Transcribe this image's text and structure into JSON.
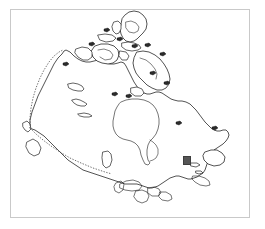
{
  "figure": {
    "title": "Map of Canada",
    "description": "Black outline map of Canada showing the Arctic Archipelago, Hudson Bay, the Great Lakes and the Atlantic coast, with dotted international borders and a single filled square site marker in southeastern Canada.",
    "background_color": "#ffffff",
    "frame_color": "#c9c9c9",
    "outline_color": "#1a1a1a",
    "marker_color": "#555555",
    "width_px": 265,
    "height_px": 229
  },
  "frame": {
    "left_px": 10,
    "top_px": 9,
    "width_px": 240,
    "height_px": 209
  },
  "map": {
    "region_name": "Canada",
    "features": [
      {
        "name": "mainland-canada",
        "type": "landmass"
      },
      {
        "name": "ellesmere-island",
        "type": "island"
      },
      {
        "name": "baffin-island",
        "type": "island"
      },
      {
        "name": "victoria-island",
        "type": "island"
      },
      {
        "name": "banks-island",
        "type": "island"
      },
      {
        "name": "newfoundland",
        "type": "island"
      },
      {
        "name": "vancouver-island",
        "type": "island"
      },
      {
        "name": "haida-gwaii",
        "type": "island"
      },
      {
        "name": "hudson-bay",
        "type": "water-body"
      },
      {
        "name": "great-lakes",
        "type": "water-body"
      },
      {
        "name": "great-bear-lake",
        "type": "water-body"
      },
      {
        "name": "great-slave-lake",
        "type": "water-body"
      },
      {
        "name": "lake-winnipeg",
        "type": "water-body"
      }
    ],
    "borders": [
      {
        "name": "alaska-yukon-border",
        "style": "dotted"
      },
      {
        "name": "canada-usa-49th-parallel",
        "style": "dotted"
      }
    ]
  },
  "marker": {
    "label": "site-marker",
    "shape": "filled-square",
    "color": "#555555",
    "x_px": 183,
    "y_px": 156,
    "size_px": 8
  }
}
